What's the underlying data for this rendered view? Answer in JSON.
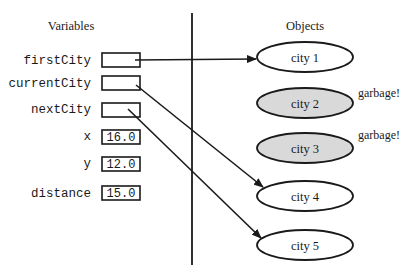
{
  "headings": {
    "variables": "Variables",
    "objects": "Objects"
  },
  "variables": [
    {
      "name": "firstCity",
      "value": "",
      "kind": "reference",
      "points_to": "city 1"
    },
    {
      "name": "currentCity",
      "value": "",
      "kind": "reference",
      "points_to": "city 4"
    },
    {
      "name": "nextCity",
      "value": "",
      "kind": "reference",
      "points_to": "city 5"
    },
    {
      "name": "x",
      "value": "16.0",
      "kind": "primitive"
    },
    {
      "name": "y",
      "value": "12.0",
      "kind": "primitive"
    },
    {
      "name": "distance",
      "value": "15.0",
      "kind": "primitive"
    }
  ],
  "objects": [
    {
      "label": "city 1",
      "garbage": false,
      "note": ""
    },
    {
      "label": "city 2",
      "garbage": true,
      "note": "garbage!"
    },
    {
      "label": "city 3",
      "garbage": true,
      "note": "garbage!"
    },
    {
      "label": "city 4",
      "garbage": false,
      "note": ""
    },
    {
      "label": "city 5",
      "garbage": false,
      "note": ""
    }
  ],
  "colors": {
    "stroke": "#1a1a1a",
    "garbage_fill": "#d9d9d9",
    "live_fill": "#ffffff"
  }
}
